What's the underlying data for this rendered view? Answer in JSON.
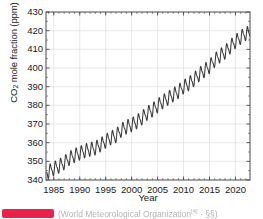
{
  "chart_data": {
    "type": "line",
    "title": "",
    "xlabel": "Year",
    "ylabel": "CO2 mole fraction (ppm)",
    "ylabel_prefix": "CO",
    "ylabel_sub": "2",
    "ylabel_suffix": " mole fraction (ppm)",
    "xlim": [
      1983.5,
      2022.8
    ],
    "ylim": [
      340,
      430
    ],
    "xticks": [
      1985,
      1990,
      1995,
      2000,
      2005,
      2010,
      2015,
      2020
    ],
    "yticks": [
      340,
      350,
      360,
      370,
      380,
      390,
      400,
      410,
      420,
      430
    ],
    "grid": true,
    "legend": "none",
    "minor_xtick_interval": 1,
    "seasonal_amplitude_ppm": 3.2,
    "line_color": "#3a3a3a",
    "grid_color": "#d8d8d8",
    "axis_color": "#4a4a4a",
    "series": [
      {
        "name": "Global mean CO2 mole fraction",
        "x": [
          1984.0,
          1985.0,
          1986.0,
          1987.0,
          1988.0,
          1989.0,
          1990.0,
          1991.0,
          1992.0,
          1993.0,
          1994.0,
          1995.0,
          1996.0,
          1997.0,
          1998.0,
          1999.0,
          2000.0,
          2001.0,
          2002.0,
          2003.0,
          2004.0,
          2005.0,
          2006.0,
          2007.0,
          2008.0,
          2009.0,
          2010.0,
          2011.0,
          2012.0,
          2013.0,
          2014.0,
          2015.0,
          2016.0,
          2017.0,
          2018.0,
          2019.0,
          2020.0,
          2021.0,
          2022.0
        ],
        "values": [
          344.4,
          346.1,
          347.4,
          349.2,
          351.6,
          353.1,
          354.4,
          355.6,
          356.4,
          357.1,
          358.8,
          360.8,
          362.6,
          363.7,
          366.7,
          368.4,
          369.6,
          371.2,
          373.3,
          375.8,
          377.5,
          379.8,
          381.9,
          383.8,
          385.6,
          387.4,
          389.9,
          391.6,
          393.8,
          396.5,
          398.6,
          400.8,
          404.2,
          406.5,
          408.5,
          411.4,
          414.2,
          416.4,
          418.5
        ]
      }
    ]
  },
  "caption": {
    "text_before": "(World Meteorological Organization",
    "ref": "[4]",
    "text_after": " · §§)",
    "badge_color": "#e8234a"
  }
}
